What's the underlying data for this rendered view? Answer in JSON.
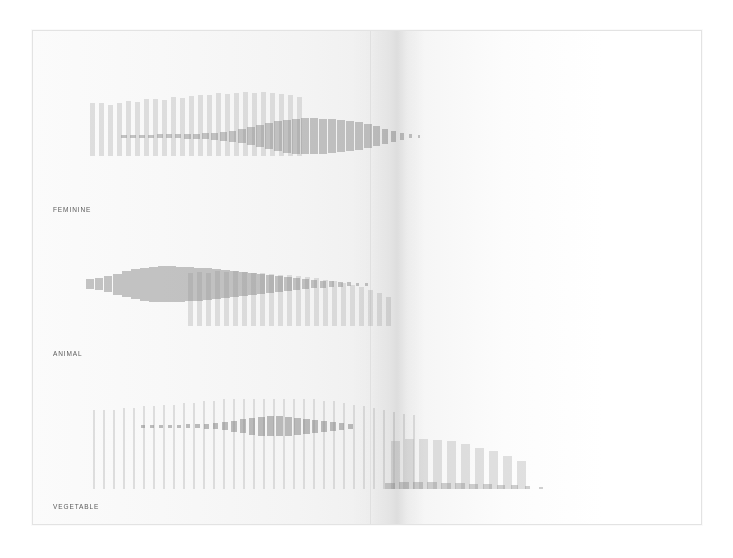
{
  "page": {
    "kind": "scanned-book-spread",
    "background_color": "#ffffff",
    "paper_color": "#fbfbfb",
    "border_color": "#e3e3e3",
    "gutter_label": "book-gutter-shadow"
  },
  "labels": {
    "row1": "FEMININE",
    "row2": "ANIMAL",
    "row3": "VEGETABLE"
  },
  "palette": {
    "light_bar": "#b8b8b8",
    "dark_bar": "#8f8f8f",
    "darkest_bar": "#828282",
    "label_text": "#5a5a5a"
  },
  "chart_data": [
    {
      "id": "feminine",
      "type": "bar",
      "title": "FEMININE",
      "xlabel": "",
      "ylabel": "",
      "grid": false,
      "legend": null,
      "axis_note": "no axes, no tick labels; abstract paired bar fields",
      "series": [
        {
          "name": "tall-light-bars",
          "style": "vertical bars rising from a common baseline, light gray, uniform width",
          "color": "#b8b8b8",
          "x": [
            57,
            66,
            75,
            84,
            93,
            102,
            111,
            120,
            129,
            138,
            147,
            156,
            165,
            174,
            183,
            192,
            201,
            210,
            219,
            228,
            237,
            246,
            255,
            264
          ],
          "width": 5,
          "values": [
            52,
            52,
            50,
            52,
            54,
            53,
            56,
            56,
            55,
            58,
            57,
            59,
            60,
            60,
            62,
            61,
            62,
            63,
            62,
            63,
            62,
            61,
            60,
            58
          ]
        },
        {
          "name": "centered-dark-bars",
          "style": "bars centered on a horizontal midline, darker gray, width grows left to right",
          "color": "#8f8f8f",
          "x": [
            88,
            97,
            106,
            115,
            124,
            133,
            142,
            151,
            160,
            169,
            178,
            187,
            196,
            205,
            214,
            223,
            232,
            241,
            250,
            259,
            268,
            277,
            286,
            295,
            304,
            313,
            322,
            331,
            340,
            349,
            358,
            367,
            376,
            385
          ],
          "values": [
            3,
            3,
            3,
            3,
            4,
            4,
            4,
            5,
            5,
            6,
            7,
            9,
            11,
            14,
            18,
            22,
            26,
            30,
            33,
            35,
            36,
            36,
            35,
            34,
            32,
            30,
            28,
            24,
            20,
            15,
            11,
            7,
            4,
            3
          ],
          "widths": [
            6,
            6,
            6,
            6,
            6,
            6,
            6,
            7,
            7,
            7,
            7,
            7,
            7,
            8,
            8,
            8,
            8,
            8,
            8,
            8,
            8,
            8,
            8,
            8,
            8,
            8,
            8,
            8,
            7,
            6,
            5,
            4,
            3,
            2
          ]
        }
      ]
    },
    {
      "id": "animal",
      "type": "bar",
      "title": "ANIMAL",
      "xlabel": "",
      "ylabel": "",
      "grid": false,
      "legend": null,
      "axis_note": "no axes, no tick labels; abstract paired bar fields",
      "series": [
        {
          "name": "tall-light-bars",
          "style": "vertical bars rising from a common baseline, light gray, start offset to the right",
          "color": "#b8b8b8",
          "x": [
            155,
            164,
            173,
            182,
            191,
            200,
            209,
            218,
            227,
            236,
            245,
            254,
            263,
            272,
            281,
            290,
            299,
            308,
            317,
            326,
            335,
            344,
            353
          ],
          "width": 5,
          "values": [
            62,
            63,
            62,
            64,
            63,
            64,
            63,
            62,
            62,
            61,
            60,
            60,
            58,
            57,
            56,
            54,
            52,
            50,
            48,
            45,
            42,
            38,
            34
          ]
        },
        {
          "name": "centered-dark-bars",
          "style": "bars centered on a horizontal midline, darker gray, widest near the left third",
          "color": "#8f8f8f",
          "x": [
            53,
            62,
            71,
            80,
            89,
            98,
            107,
            116,
            125,
            134,
            143,
            152,
            161,
            170,
            179,
            188,
            197,
            206,
            215,
            224,
            233,
            242,
            251,
            260,
            269,
            278,
            287,
            296,
            305,
            314,
            323,
            332
          ],
          "values": [
            10,
            12,
            16,
            21,
            26,
            30,
            33,
            35,
            36,
            36,
            35,
            34,
            33,
            32,
            30,
            28,
            26,
            24,
            22,
            20,
            18,
            16,
            14,
            12,
            10,
            8,
            7,
            6,
            5,
            4,
            3,
            3
          ],
          "widths": [
            8,
            8,
            8,
            9,
            9,
            9,
            9,
            9,
            9,
            9,
            9,
            9,
            9,
            9,
            9,
            9,
            9,
            9,
            9,
            8,
            8,
            8,
            8,
            7,
            7,
            6,
            6,
            5,
            5,
            4,
            3,
            3
          ]
        }
      ]
    },
    {
      "id": "vegetable",
      "type": "bar",
      "title": "VEGETABLE",
      "xlabel": "",
      "ylabel": "",
      "grid": false,
      "legend": null,
      "axis_note": "no axes, no tick labels; two separate bar fields split by the book gutter",
      "series": [
        {
          "name": "tall-thin-light-bars",
          "style": "very thin tall vertical bars, light gray, full-height field on the left page",
          "color": "#b8b8b8",
          "x": [
            60,
            70,
            80,
            90,
            100,
            110,
            120,
            130,
            140,
            150,
            160,
            170,
            180,
            190,
            200,
            210,
            220,
            230,
            240,
            250,
            260,
            270,
            280,
            290,
            300,
            310,
            320,
            330,
            340,
            350,
            360,
            370,
            380
          ],
          "width": 2,
          "values": [
            88,
            88,
            88,
            90,
            90,
            92,
            92,
            94,
            94,
            96,
            96,
            98,
            98,
            100,
            100,
            100,
            100,
            100,
            100,
            100,
            100,
            100,
            100,
            98,
            98,
            96,
            94,
            92,
            90,
            88,
            86,
            84,
            82
          ]
        },
        {
          "name": "centered-dark-thin-bars",
          "style": "thin bars centered on a horizontal midline, dark gray, peaking mid-left page",
          "color": "#828282",
          "x": [
            108,
            117,
            126,
            135,
            144,
            153,
            162,
            171,
            180,
            189,
            198,
            207,
            216,
            225,
            234,
            243,
            252,
            261,
            270,
            279,
            288,
            297,
            306,
            315
          ],
          "values": [
            3,
            3,
            3,
            3,
            3,
            4,
            4,
            5,
            6,
            8,
            11,
            14,
            17,
            19,
            20,
            20,
            19,
            17,
            15,
            13,
            11,
            9,
            7,
            5
          ],
          "widths": [
            4,
            4,
            4,
            4,
            4,
            4,
            5,
            5,
            5,
            6,
            6,
            6,
            6,
            7,
            7,
            7,
            7,
            7,
            7,
            6,
            6,
            6,
            5,
            5
          ]
        },
        {
          "name": "right-group-light-bars",
          "style": "wider light vertical bars on the right page, heights taper to the right",
          "color": "#b8b8b8",
          "x": [
            358,
            372,
            386,
            400,
            414,
            428,
            442,
            456,
            470,
            484
          ],
          "width": 9,
          "values": [
            54,
            56,
            56,
            55,
            53,
            50,
            46,
            42,
            37,
            31
          ]
        },
        {
          "name": "right-group-dark-bars",
          "style": "centered dark bars over the right group, shrinking to a thin tail",
          "color": "#8f8f8f",
          "x": [
            352,
            366,
            380,
            394,
            408,
            422,
            436,
            450,
            464,
            478,
            492,
            506
          ],
          "values": [
            7,
            8,
            8,
            8,
            7,
            7,
            6,
            6,
            5,
            4,
            3,
            2
          ],
          "widths": [
            10,
            10,
            10,
            10,
            10,
            10,
            9,
            9,
            8,
            7,
            5,
            4
          ]
        }
      ]
    }
  ]
}
